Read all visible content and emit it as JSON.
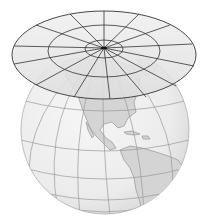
{
  "figure": {
    "title": "Planar (azimuthal) projection",
    "colors": {
      "background": "#ffffff",
      "globe_fill": "#eeeeee",
      "globe_shade": "#d9d9d9",
      "land_fill": "#d4d4d4",
      "land_stroke": "#8a8a8a",
      "graticule": "#9a9a9a",
      "plane_fill": "#e6e6e6",
      "plane_stroke": "#333333"
    },
    "plane": {
      "center": [
        104,
        53
      ],
      "rings": 3,
      "radial_lines": 16
    },
    "globe": {
      "center": [
        105,
        130
      ],
      "radius": 84,
      "continents": [
        "North America",
        "Central America",
        "South America",
        "Greenland"
      ]
    }
  }
}
